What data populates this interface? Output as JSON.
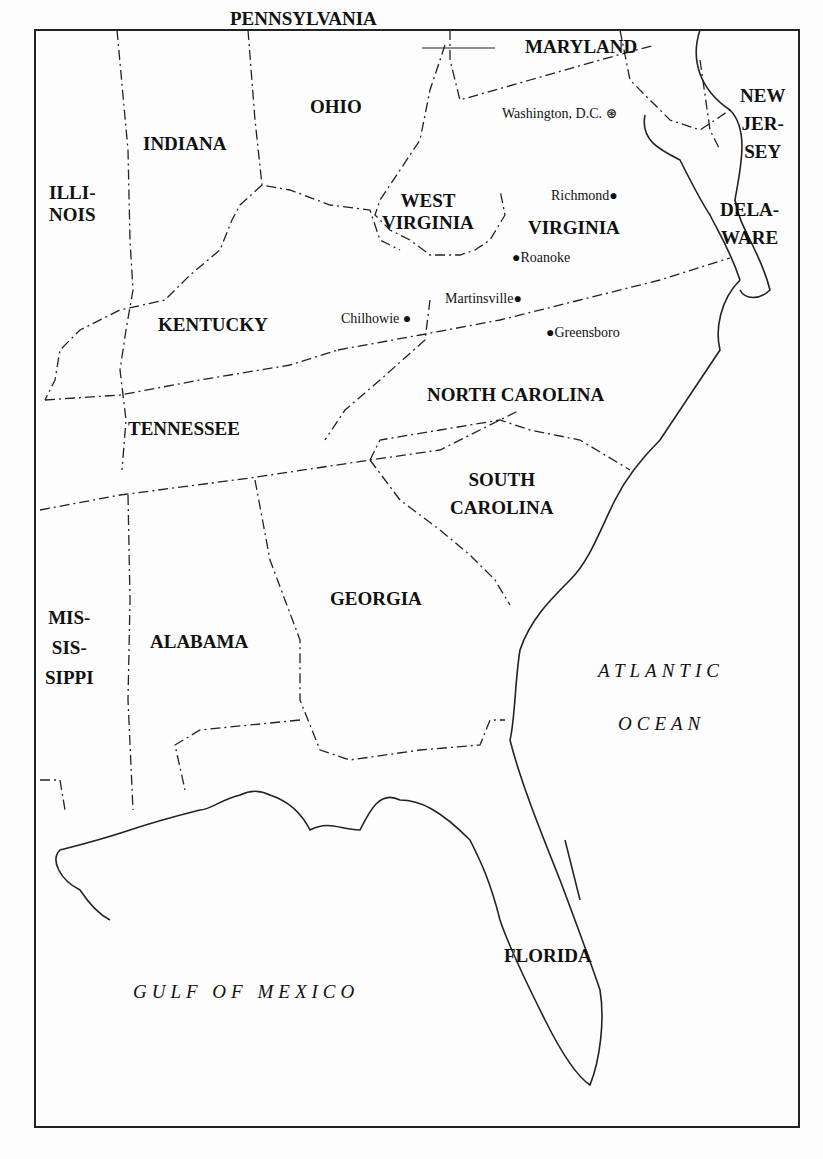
{
  "states": {
    "pennsylvania": "PENNSYLVANIA",
    "maryland": "MARYLAND",
    "ohio": "OHIO",
    "indiana": "INDIANA",
    "illinois": [
      "ILLI-",
      "NOIS"
    ],
    "west_virginia": [
      "WEST",
      "VIRGINIA"
    ],
    "virginia": "VIRGINIA",
    "new_jersey": [
      "NEW",
      "JER-",
      "SEY"
    ],
    "delaware": [
      "DELA-",
      "WARE"
    ],
    "kentucky": "KENTUCKY",
    "tennessee": "TENNESSEE",
    "north_carolina": "NORTH CAROLINA",
    "south_carolina": [
      "SOUTH",
      "CAROLINA"
    ],
    "georgia": "GEORGIA",
    "alabama": "ALABAMA",
    "mississippi": [
      "MIS-",
      "SIS-",
      "SIPPI"
    ],
    "florida": "FLORIDA"
  },
  "cities": {
    "washington": "Washington, D.C.",
    "richmond": "Richmond",
    "roanoke": "Roanoke",
    "martinsville": "Martinsville",
    "chilhowie": "Chilhowie",
    "greensboro": "Greensboro"
  },
  "water": {
    "atlantic_1": "ATLANTIC",
    "atlantic_2": "OCEAN",
    "gulf": "GULF OF MEXICO"
  }
}
